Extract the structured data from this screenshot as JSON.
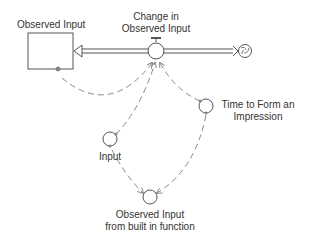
{
  "diagram": {
    "type": "stock-and-flow",
    "stock": {
      "label": "Observed Input"
    },
    "flow": {
      "label_line1": "Change in",
      "label_line2": "Observed Input"
    },
    "aux_time": {
      "label_line1": "Time to Form an",
      "label_line2": "Impression"
    },
    "aux_input": {
      "label": "Input"
    },
    "aux_output": {
      "label_line1": "Observed Input",
      "label_line2": "from built in function"
    },
    "colors": {
      "line": "#555555",
      "dashed": "#888888",
      "text": "#333333"
    }
  }
}
